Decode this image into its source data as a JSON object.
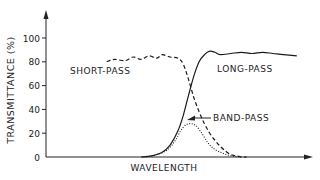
{
  "chart_data": {
    "type": "line",
    "title": "",
    "xlabel": "WAVELENGTH",
    "ylabel": "TRANSMITTANCE (%)",
    "ylim": [
      0,
      100
    ],
    "xlim": [
      0,
      100
    ],
    "yticks": [
      "0",
      "20",
      "40",
      "60",
      "80",
      "100"
    ],
    "ytick_values": [
      0,
      20,
      40,
      60,
      80,
      100
    ],
    "grid": false,
    "series": [
      {
        "name": "SHORT-PASS",
        "style": "dashed",
        "x": [
          23,
          26,
          30,
          33,
          36,
          39,
          42,
          44,
          47,
          50,
          52,
          54,
          56,
          58,
          60,
          62,
          64,
          66,
          68,
          70,
          72,
          74,
          76
        ],
        "y": [
          80,
          82,
          81,
          84,
          82,
          85,
          83,
          86,
          84,
          83,
          78,
          65,
          50,
          38,
          28,
          20,
          14,
          9,
          5,
          2,
          1,
          0,
          0
        ]
      },
      {
        "name": "LONG-PASS",
        "style": "solid",
        "x": [
          36,
          40,
          44,
          47,
          50,
          52,
          54,
          56,
          58,
          60,
          62,
          64,
          66,
          70,
          74,
          78,
          82,
          86,
          90,
          95
        ],
        "y": [
          0,
          1,
          4,
          10,
          22,
          35,
          52,
          68,
          80,
          86,
          89,
          88,
          86,
          87,
          88,
          87,
          88,
          87,
          86,
          85
        ]
      },
      {
        "name": "BAND-PASS",
        "style": "dotted",
        "x": [
          38,
          42,
          46,
          49,
          51,
          53,
          55,
          57,
          59,
          61,
          63,
          66,
          70,
          74
        ],
        "y": [
          0,
          2,
          6,
          14,
          22,
          27,
          28,
          26,
          20,
          13,
          8,
          4,
          1,
          0
        ]
      }
    ],
    "annotations": [
      {
        "text": "SHORT-PASS",
        "target": "SHORT-PASS"
      },
      {
        "text": "LONG-PASS",
        "target": "LONG-PASS"
      },
      {
        "text": "BAND-PASS",
        "target": "BAND-PASS",
        "arrow": true
      }
    ]
  }
}
